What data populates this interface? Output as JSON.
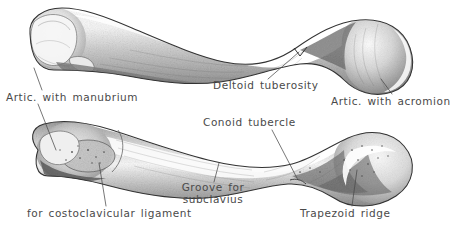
{
  "figure": {
    "views": [
      {
        "name": "superior-view-clavicle",
        "position": "top"
      },
      {
        "name": "inferior-view-clavicle",
        "position": "bottom"
      }
    ],
    "style": "pencil-stipple-shaded-line-drawing",
    "background_color": "#ffffff",
    "ink_color": "#3b3b3b",
    "label_color": "#4a4a4a"
  },
  "labels": {
    "manubrium": "Artic. with manubrium",
    "deltoid": "Deltoid  tuberosity",
    "acromion": "Artic. with acromion",
    "conoid": "Conoid  tubercle",
    "groove_line1": "Groove  for",
    "groove_line2": "subclavius",
    "costoclavicular": "for costoclavicular  ligament",
    "trapezoid": "Trapezoid  ridge"
  }
}
